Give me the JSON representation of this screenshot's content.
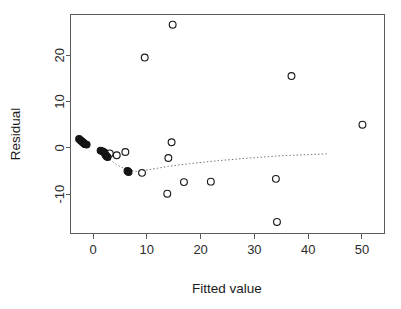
{
  "chart_data": {
    "type": "scatter",
    "title": "",
    "subtitle": "",
    "xlabel": "Fitted value",
    "ylabel": "Residual",
    "xlim": [
      -4.2,
      54.2
    ],
    "ylim": [
      -18.5,
      28.8
    ],
    "xticks": [
      0,
      10,
      20,
      30,
      40,
      50
    ],
    "xtick_labels": [
      "0",
      "10",
      "20",
      "30",
      "40",
      "50"
    ],
    "yticks": [
      -10,
      0,
      10,
      20
    ],
    "ytick_labels": [
      "-10",
      "0",
      "10",
      "20"
    ],
    "grid": false,
    "legend": null,
    "legend_position": "none",
    "box": true,
    "marker": "open-circle",
    "points": [
      {
        "x": -2.6,
        "y": 1.9,
        "filled": true
      },
      {
        "x": -2.3,
        "y": 1.6,
        "filled": true
      },
      {
        "x": -2.1,
        "y": 1.4,
        "filled": true
      },
      {
        "x": -1.9,
        "y": 1.2,
        "filled": true
      },
      {
        "x": -1.7,
        "y": 1.0,
        "filled": true
      },
      {
        "x": -1.5,
        "y": 0.8,
        "filled": true
      },
      {
        "x": -1.2,
        "y": 0.7,
        "filled": true
      },
      {
        "x": 1.4,
        "y": -0.6,
        "filled": true
      },
      {
        "x": 1.8,
        "y": -0.8,
        "filled": true
      },
      {
        "x": 2.1,
        "y": -1.0,
        "filled": true
      },
      {
        "x": 2.3,
        "y": -1.5,
        "filled": true
      },
      {
        "x": 2.5,
        "y": -1.8,
        "filled": true
      },
      {
        "x": 2.7,
        "y": -2.0,
        "filled": true
      },
      {
        "x": 3.1,
        "y": -1.2,
        "filled": false
      },
      {
        "x": 4.4,
        "y": -1.6,
        "filled": false
      },
      {
        "x": 6.0,
        "y": -0.9,
        "filled": false
      },
      {
        "x": 6.4,
        "y": -5.0,
        "filled": true
      },
      {
        "x": 6.6,
        "y": -5.2,
        "filled": true
      },
      {
        "x": 9.1,
        "y": -5.4,
        "filled": false
      },
      {
        "x": 9.6,
        "y": 19.5,
        "filled": false
      },
      {
        "x": 13.8,
        "y": -9.9,
        "filled": false
      },
      {
        "x": 14.0,
        "y": -2.2,
        "filled": false
      },
      {
        "x": 14.6,
        "y": 1.2,
        "filled": false
      },
      {
        "x": 14.8,
        "y": 26.6,
        "filled": false
      },
      {
        "x": 16.9,
        "y": -7.4,
        "filled": false
      },
      {
        "x": 21.9,
        "y": -7.3,
        "filled": false
      },
      {
        "x": 34.0,
        "y": -6.7,
        "filled": false
      },
      {
        "x": 34.2,
        "y": -16.0,
        "filled": false
      },
      {
        "x": 36.9,
        "y": 15.5,
        "filled": false
      },
      {
        "x": 50.1,
        "y": 5.0,
        "filled": false
      }
    ],
    "trend_line": {
      "style": "dotted",
      "label": "lowess smoother",
      "points": [
        {
          "x": 2.6,
          "y": -2.0
        },
        {
          "x": 4.3,
          "y": -3.6
        },
        {
          "x": 6.0,
          "y": -4.6
        },
        {
          "x": 8.0,
          "y": -5.1
        },
        {
          "x": 10.5,
          "y": -4.7
        },
        {
          "x": 14.0,
          "y": -4.0
        },
        {
          "x": 18.0,
          "y": -3.4
        },
        {
          "x": 23.0,
          "y": -2.8
        },
        {
          "x": 29.0,
          "y": -2.2
        },
        {
          "x": 35.0,
          "y": -1.7
        },
        {
          "x": 43.5,
          "y": -1.3
        }
      ]
    }
  }
}
